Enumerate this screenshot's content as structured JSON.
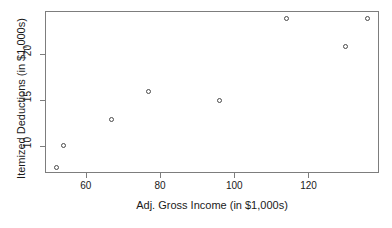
{
  "chart_data": {
    "type": "scatter",
    "title": "",
    "xlabel": "Adj. Gross Income (in $1,000s)",
    "ylabel": "Itemized Deductions (in $1,000s)",
    "xlim": [
      49,
      139
    ],
    "ylim": [
      7.0,
      24.7
    ],
    "grid": false,
    "legend": null,
    "xticks": [
      60,
      80,
      100,
      120
    ],
    "xtick_labels": [
      "60",
      "80",
      "100",
      "120"
    ],
    "yticks": [
      10,
      15,
      20
    ],
    "ytick_labels": [
      "10",
      "15",
      "20"
    ],
    "marker": "open-circle",
    "marker_color": "#4a4a4a",
    "points": [
      {
        "x": 52,
        "y": 7.6
      },
      {
        "x": 54,
        "y": 10.0
      },
      {
        "x": 67,
        "y": 12.9
      },
      {
        "x": 77,
        "y": 15.9
      },
      {
        "x": 96,
        "y": 14.9
      },
      {
        "x": 114,
        "y": 23.9
      },
      {
        "x": 130,
        "y": 20.8
      },
      {
        "x": 136,
        "y": 23.9
      }
    ],
    "x": [
      52,
      54,
      67,
      77,
      96,
      114,
      130,
      136
    ],
    "y": [
      7.6,
      10.0,
      12.9,
      15.9,
      14.9,
      23.9,
      20.8,
      23.9
    ]
  },
  "colors": {
    "frame": "#7d7d7d",
    "axis_text": "#1a1a1a",
    "background": "#ffffff"
  }
}
